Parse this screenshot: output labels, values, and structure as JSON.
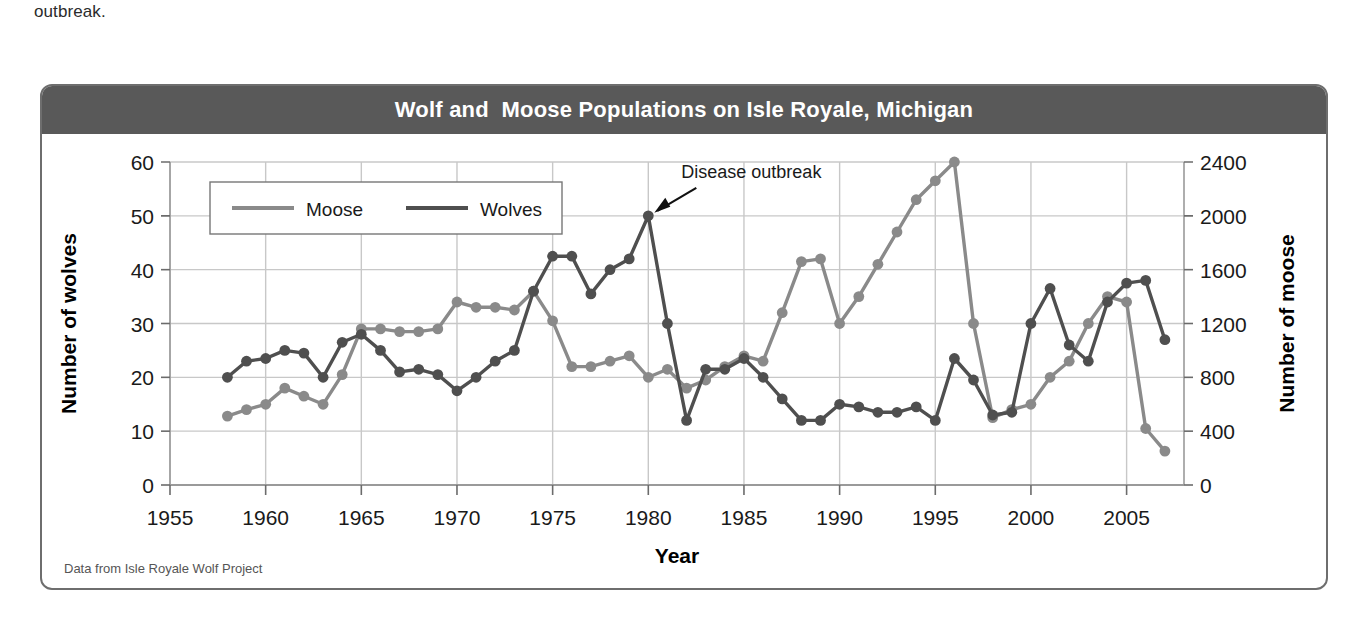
{
  "page": {
    "continuation_text": "outbreak."
  },
  "figure": {
    "title": "Wolf and  Moose Populations on Isle Royale, Michigan",
    "source_note": "Data from Isle Royale Wolf Project"
  },
  "chart_data": {
    "type": "line",
    "title": "Wolf and  Moose Populations on Isle Royale, Michigan",
    "xlabel": "Year",
    "ylabel": "Number of wolves",
    "y2label": "Number of moose",
    "xlim": [
      1955,
      2008
    ],
    "ylim": [
      0,
      60
    ],
    "y2lim": [
      0,
      2400
    ],
    "xticks": [
      1955,
      1960,
      1965,
      1970,
      1975,
      1980,
      1985,
      1990,
      1995,
      2000,
      2005
    ],
    "yticks": [
      0,
      10,
      20,
      30,
      40,
      50,
      60
    ],
    "y2ticks": [
      0,
      400,
      800,
      1200,
      1600,
      2000,
      2400
    ],
    "grid": true,
    "legend_position": "upper-left",
    "colors": {
      "moose": "#8a8a8a",
      "wolves": "#4f4f4f",
      "title_bar": "#595959",
      "frame": "#6e6e6e",
      "grid": "#c8c8c8"
    },
    "annotations": [
      {
        "text": "Disease outbreak",
        "points_to_year": 1980,
        "points_to_wolves": 50
      }
    ],
    "series": [
      {
        "name": "Moose",
        "axis": "right",
        "units": "number of moose",
        "x": [
          1958,
          1959,
          1960,
          1961,
          1962,
          1963,
          1964,
          1965,
          1966,
          1967,
          1968,
          1969,
          1970,
          1971,
          1972,
          1973,
          1974,
          1975,
          1976,
          1977,
          1978,
          1979,
          1980,
          1981,
          1982,
          1983,
          1984,
          1985,
          1986,
          1987,
          1988,
          1989,
          1990,
          1991,
          1992,
          1993,
          1994,
          1995,
          1996,
          1997,
          1998,
          1999,
          2000,
          2001,
          2002,
          2003,
          2004,
          2005,
          2006,
          2007
        ],
        "values_right": [
          510,
          560,
          600,
          720,
          660,
          600,
          820,
          1160,
          1160,
          1140,
          1140,
          1160,
          1360,
          1320,
          1320,
          1300,
          1440,
          1220,
          880,
          880,
          920,
          960,
          800,
          860,
          720,
          780,
          880,
          960,
          920,
          1280,
          1660,
          1680,
          1200,
          1400,
          1640,
          1880,
          2120,
          2260,
          2400,
          1200,
          500,
          560,
          600,
          800,
          920,
          1200,
          1400,
          1360,
          420,
          250
        ],
        "values_left_scale": [
          12.8,
          14,
          15,
          18,
          16.5,
          15,
          20.5,
          29,
          29,
          28.5,
          28.5,
          29,
          34,
          33,
          33,
          32.5,
          36,
          30.5,
          22,
          22,
          23,
          24,
          20,
          21.5,
          18,
          19.5,
          22,
          24,
          23,
          32,
          41.5,
          42,
          30,
          35,
          41,
          47,
          53,
          56.5,
          60,
          30,
          12.5,
          14,
          15,
          20,
          23,
          30,
          35,
          34,
          10.5,
          6.3
        ]
      },
      {
        "name": "Wolves",
        "axis": "left",
        "units": "number of wolves",
        "x": [
          1958,
          1959,
          1960,
          1961,
          1962,
          1963,
          1964,
          1965,
          1966,
          1967,
          1968,
          1969,
          1970,
          1971,
          1972,
          1973,
          1974,
          1975,
          1976,
          1977,
          1978,
          1979,
          1980,
          1981,
          1982,
          1983,
          1984,
          1985,
          1986,
          1987,
          1988,
          1989,
          1990,
          1991,
          1992,
          1993,
          1994,
          1995,
          1996,
          1997,
          1998,
          1999,
          2000,
          2001,
          2002,
          2003,
          2004,
          2005,
          2006,
          2007
        ],
        "values": [
          20,
          23,
          23.5,
          25,
          24.5,
          20,
          26.5,
          28,
          25,
          21,
          21.5,
          20.5,
          17.5,
          20,
          23,
          25,
          36,
          42.5,
          42.5,
          35.5,
          40,
          42,
          50,
          30,
          12,
          21.5,
          21.5,
          23.5,
          20,
          16,
          12,
          12,
          15,
          14.5,
          13.5,
          13.5,
          14.5,
          12,
          23.5,
          19.5,
          13,
          13.5,
          30,
          36.5,
          26,
          23,
          34,
          37.5,
          38,
          27
        ]
      }
    ]
  },
  "legend": {
    "items": [
      {
        "label": "Moose",
        "color": "#8a8a8a"
      },
      {
        "label": "Wolves",
        "color": "#4f4f4f"
      }
    ]
  },
  "axes": {
    "left_title": "Number of wolves",
    "right_title": "Number of moose",
    "x_title": "Year"
  }
}
